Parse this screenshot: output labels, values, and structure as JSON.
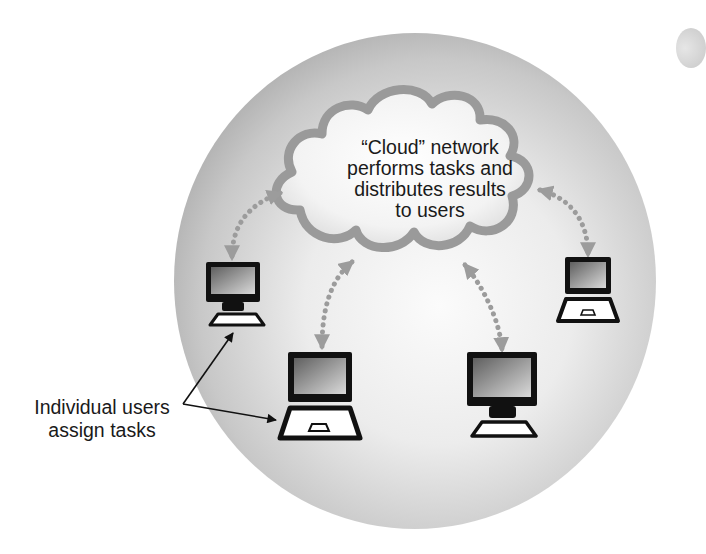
{
  "diagram": {
    "type": "network-concept",
    "cloud": {
      "label_lines": [
        "“Cloud” network",
        "performs tasks and",
        "distributes results",
        "to users"
      ]
    },
    "callout": {
      "label_lines": [
        "Individual users",
        "assign tasks"
      ],
      "points_to": [
        "desktop-left",
        "laptop-bottom-left"
      ]
    },
    "nodes": [
      {
        "id": "desktop-left",
        "kind": "desktop"
      },
      {
        "id": "laptop-bottom-left",
        "kind": "laptop"
      },
      {
        "id": "desktop-bottom-right",
        "kind": "desktop"
      },
      {
        "id": "laptop-right",
        "kind": "laptop"
      }
    ],
    "connections": [
      {
        "from": "cloud",
        "to": "desktop-left",
        "style": "dotted-bidirectional"
      },
      {
        "from": "cloud",
        "to": "laptop-bottom-left",
        "style": "dotted-bidirectional"
      },
      {
        "from": "cloud",
        "to": "desktop-bottom-right",
        "style": "dotted-bidirectional"
      },
      {
        "from": "cloud",
        "to": "laptop-right",
        "style": "dotted-bidirectional"
      }
    ],
    "colors": {
      "sphere_light": "#f7f7f7",
      "sphere_dark": "#a9a9a9",
      "cloud_outline": "#9a9a9a",
      "arrow_dots": "#9c9c9c",
      "device_outline": "#111111",
      "screen_dark": "#6e6e6e",
      "screen_light": "#c9c9c9",
      "text": "#1a1a1a"
    }
  }
}
